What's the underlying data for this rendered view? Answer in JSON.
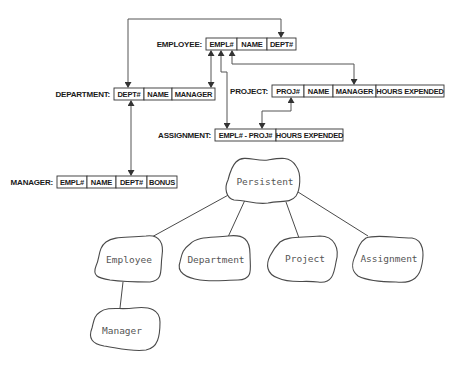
{
  "tables": [
    {
      "id": "employee",
      "label": "EMPLOYEE:",
      "label_x": 202,
      "x": 206,
      "y": 38,
      "h": 12,
      "cells": [
        {
          "text": "EMPL#",
          "w": 31
        },
        {
          "text": "NAME",
          "w": 30
        },
        {
          "text": "DEPT#",
          "w": 29
        }
      ]
    },
    {
      "id": "department",
      "label": "DEPARTMENT:",
      "label_x": 110,
      "x": 114,
      "y": 88,
      "h": 12,
      "cells": [
        {
          "text": "DEPT#",
          "w": 30
        },
        {
          "text": "NAME",
          "w": 28
        },
        {
          "text": "MANAGER",
          "w": 43
        }
      ]
    },
    {
      "id": "project",
      "label": "PROJECT:",
      "label_x": 268,
      "x": 272,
      "y": 85,
      "h": 12,
      "cells": [
        {
          "text": "PROJ#",
          "w": 32
        },
        {
          "text": "NAME",
          "w": 29
        },
        {
          "text": "MANAGER",
          "w": 43
        },
        {
          "text": "HOURS EXPENDED",
          "w": 68
        }
      ]
    },
    {
      "id": "assignment",
      "label": "ASSIGNMENT:",
      "label_x": 211,
      "x": 215,
      "y": 129,
      "h": 12,
      "cells": [
        {
          "text": "EMPL# - PROJ#",
          "w": 61
        },
        {
          "text": "HOURS EXPENDED",
          "w": 67
        }
      ]
    },
    {
      "id": "manager",
      "label": "MANAGER:",
      "label_x": 53,
      "x": 57,
      "y": 176,
      "h": 12,
      "cells": [
        {
          "text": "EMPL#",
          "w": 30
        },
        {
          "text": "NAME",
          "w": 29
        },
        {
          "text": "DEPT#",
          "w": 31
        },
        {
          "text": "BONUS",
          "w": 30
        }
      ]
    }
  ],
  "connectors": [
    {
      "id": "dept-fk-employee",
      "points": [
        [
          128,
          87
        ],
        [
          128,
          19
        ],
        [
          281,
          19
        ],
        [
          281,
          37
        ]
      ],
      "start_arrow": true,
      "end_arrow": true
    },
    {
      "id": "employee-manager-dept-manager",
      "points": [
        [
          211,
          51
        ],
        [
          211,
          87
        ]
      ],
      "start_arrow": true,
      "end_arrow": true
    },
    {
      "id": "employee-empl-assignment",
      "points": [
        [
          221,
          51
        ],
        [
          221,
          72
        ],
        [
          227,
          72
        ],
        [
          227,
          128
        ]
      ],
      "start_arrow": true,
      "end_arrow": true
    },
    {
      "id": "employee-empl-project-manager",
      "points": [
        [
          232,
          51
        ],
        [
          232,
          64
        ],
        [
          354,
          64
        ],
        [
          354,
          84
        ]
      ],
      "start_arrow": true,
      "end_arrow": true
    },
    {
      "id": "project-proj-assignment",
      "points": [
        [
          291,
          98
        ],
        [
          291,
          111
        ],
        [
          262,
          111
        ],
        [
          262,
          128
        ]
      ],
      "start_arrow": true,
      "end_arrow": true
    },
    {
      "id": "department-manager-table",
      "points": [
        [
          131,
          101
        ],
        [
          131,
          175
        ]
      ],
      "start_arrow": true,
      "end_arrow": true
    }
  ],
  "hierarchy": {
    "root": {
      "id": "persistent",
      "label": "Persistent",
      "cx": 269,
      "cy": 182
    },
    "children": [
      {
        "id": "employee",
        "label": "Employee",
        "cx": 128,
        "cy": 260
      },
      {
        "id": "department",
        "label": "Department",
        "cx": 215,
        "cy": 260
      },
      {
        "id": "project",
        "label": "Project",
        "cx": 305,
        "cy": 259
      },
      {
        "id": "assignment",
        "label": "Assignment",
        "cx": 389,
        "cy": 259
      }
    ],
    "grandchildren": [
      {
        "id": "manager",
        "parent": "employee",
        "label": "Manager",
        "cx": 122,
        "cy": 331
      }
    ]
  }
}
